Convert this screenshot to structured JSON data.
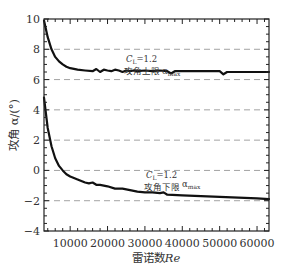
{
  "chart_data": {
    "type": "line",
    "title": "",
    "xlabel": "雷诺数Re",
    "ylabel": "攻角 α/(°)",
    "xlim": [
      3000,
      63200
    ],
    "ylim": [
      -4,
      10
    ],
    "grid": "horizontal dashed at y=8,6,4,2,0,-2",
    "x_ticks": [
      10000,
      20000,
      30000,
      40000,
      50000,
      60000
    ],
    "x_tick_labels": [
      "10000",
      "20000",
      "30000",
      "40000",
      "50000",
      "60000"
    ],
    "y_ticks": [
      10,
      8,
      6,
      4,
      2,
      0,
      -2,
      -4
    ],
    "y_tick_labels": [
      "10",
      "8",
      "6",
      "4",
      "2",
      "0",
      "−2",
      "−4"
    ],
    "series": [
      {
        "name": "攻角上限 α_max (C_L=1.2)",
        "x": [
          3000,
          4000,
          5000,
          6000,
          7000,
          8000,
          9000,
          10000,
          12000,
          14000,
          16000,
          17000,
          18000,
          19000,
          20000,
          21000,
          22000,
          23000,
          24000,
          25000,
          26000,
          27000,
          28000,
          30000,
          32000,
          34000,
          36000,
          37000,
          38000,
          40000,
          42000,
          45000,
          48000,
          50000,
          51000,
          52000,
          55000,
          58000,
          60000,
          63200
        ],
        "values": [
          9.9,
          8.8,
          8.0,
          7.5,
          7.2,
          7.0,
          6.85,
          6.75,
          6.65,
          6.6,
          6.55,
          6.7,
          6.5,
          6.65,
          6.6,
          6.55,
          6.65,
          6.6,
          6.5,
          6.6,
          6.55,
          6.6,
          6.55,
          6.6,
          6.55,
          6.6,
          6.55,
          6.4,
          6.55,
          6.55,
          6.55,
          6.55,
          6.55,
          6.55,
          6.35,
          6.5,
          6.5,
          6.5,
          6.5,
          6.5
        ]
      },
      {
        "name": "攻角下限 α_max (C_L=1.2)",
        "x": [
          3000,
          4000,
          5000,
          6000,
          7000,
          8000,
          9000,
          10000,
          12000,
          14000,
          15000,
          16000,
          17000,
          18000,
          20000,
          22000,
          24000,
          26000,
          28000,
          30000,
          32000,
          34000,
          35000,
          36000,
          40000,
          45000,
          50000,
          55000,
          60000,
          63200
        ],
        "values": [
          4.8,
          2.8,
          1.6,
          0.8,
          0.3,
          0.0,
          -0.25,
          -0.4,
          -0.6,
          -0.8,
          -0.85,
          -0.8,
          -0.95,
          -0.95,
          -1.05,
          -1.2,
          -1.2,
          -1.3,
          -1.4,
          -1.45,
          -1.45,
          -1.5,
          -1.45,
          -1.6,
          -1.65,
          -1.7,
          -1.75,
          -1.8,
          -1.85,
          -1.9
        ]
      }
    ],
    "annotations": [
      {
        "text_line1": "C_L=1.2",
        "text_line2": "攻角上限 α_max",
        "near": [
          37000,
          7.2
        ]
      },
      {
        "text_line1": "C_L=1.2",
        "text_line2": "攻角下限 α_max",
        "near": [
          37000,
          -0.9
        ]
      }
    ],
    "legend": "none"
  },
  "labels": {
    "xlabel_cn": "雷诺数",
    "xlabel_sym": "Re",
    "ylabel": "攻角 α/(°)",
    "upper_cl": "C",
    "upper_cl_sub": "L",
    "upper_cl_val": "=1.2",
    "upper_name": "攻角上限",
    "upper_alpha": "α",
    "upper_alpha_sub": "max",
    "lower_cl": "C",
    "lower_cl_sub": "L",
    "lower_cl_val": "=1.2",
    "lower_name": "攻角下限",
    "lower_alpha": "α",
    "lower_alpha_sub": "max"
  }
}
